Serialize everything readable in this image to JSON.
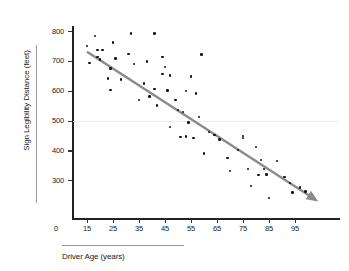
{
  "chart_data": {
    "type": "scatter",
    "title": "",
    "xlabel": "Driver Age (years)",
    "ylabel": "Sign Legibility Distance (feet)",
    "xlim": [
      10,
      102
    ],
    "ylim": [
      220,
      820
    ],
    "xticks": [
      15,
      25,
      35,
      45,
      55,
      65,
      75,
      85,
      95
    ],
    "yticks": [
      300,
      400,
      500,
      600,
      700,
      800
    ],
    "origin_label": "0",
    "grid": "single faint horizontal line at y=500",
    "gridlines_y": [
      500
    ],
    "legend": "none",
    "annotations": [
      {
        "type": "trend-line",
        "style": "solid gray with arrowhead at right end",
        "from": [
          15,
          730
        ],
        "to": [
          101,
          245
        ],
        "color": "#8a8a8a"
      }
    ],
    "points": [
      [
        15,
        750
      ],
      [
        16,
        693
      ],
      [
        18,
        783
      ],
      [
        19,
        737
      ],
      [
        19,
        712
      ],
      [
        20,
        705
      ],
      [
        21,
        737
      ],
      [
        23,
        640
      ],
      [
        24,
        603
      ],
      [
        24,
        675
      ],
      [
        25,
        762
      ],
      [
        26,
        708
      ],
      [
        28,
        638
      ],
      [
        31,
        722
      ],
      [
        32,
        792
      ],
      [
        33,
        690
      ],
      [
        35,
        568
      ],
      [
        37,
        624
      ],
      [
        38,
        697
      ],
      [
        39,
        580
      ],
      [
        41,
        792
      ],
      [
        41,
        605
      ],
      [
        42,
        551
      ],
      [
        44,
        712
      ],
      [
        44,
        655
      ],
      [
        45,
        679
      ],
      [
        46,
        600
      ],
      [
        47,
        650
      ],
      [
        47,
        479
      ],
      [
        49,
        568
      ],
      [
        50,
        536
      ],
      [
        51,
        444
      ],
      [
        52,
        528
      ],
      [
        53,
        599
      ],
      [
        53,
        447
      ],
      [
        54,
        494
      ],
      [
        55,
        648
      ],
      [
        56,
        441
      ],
      [
        57,
        591
      ],
      [
        58,
        511
      ],
      [
        59,
        721
      ],
      [
        60,
        389
      ],
      [
        62,
        462
      ],
      [
        64,
        452
      ],
      [
        66,
        437
      ],
      [
        69,
        375
      ],
      [
        70,
        331
      ],
      [
        73,
        402
      ],
      [
        75,
        448
      ],
      [
        75,
        441
      ],
      [
        77,
        338
      ],
      [
        78,
        281
      ],
      [
        80,
        412
      ],
      [
        81,
        318
      ],
      [
        82,
        368
      ],
      [
        83,
        338
      ],
      [
        84,
        319
      ],
      [
        85,
        240
      ],
      [
        88,
        365
      ],
      [
        91,
        310
      ],
      [
        93,
        290
      ],
      [
        94,
        258
      ],
      [
        97,
        276
      ],
      [
        99,
        262
      ]
    ],
    "point_color": "#111111",
    "axis_color": "#222222"
  }
}
